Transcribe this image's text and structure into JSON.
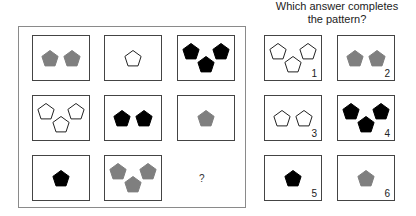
{
  "question": {
    "line1": "Which answer completes",
    "line2": "the pattern?"
  },
  "colors": {
    "gray": "#7f7f7f",
    "black": "#000000",
    "outline": "#222222"
  },
  "matrix": [
    {
      "count": 2,
      "fill": "gray"
    },
    {
      "count": 1,
      "fill": "white"
    },
    {
      "count": 3,
      "fill": "black"
    },
    {
      "count": 3,
      "fill": "white"
    },
    {
      "count": 2,
      "fill": "black"
    },
    {
      "count": 1,
      "fill": "gray"
    },
    {
      "count": 1,
      "fill": "black"
    },
    {
      "count": 3,
      "fill": "gray"
    }
  ],
  "missing_symbol": "?",
  "answers": [
    {
      "label": "1",
      "count": 3,
      "fill": "white"
    },
    {
      "label": "2",
      "count": 2,
      "fill": "gray"
    },
    {
      "label": "3",
      "count": 2,
      "fill": "white"
    },
    {
      "label": "4",
      "count": 3,
      "fill": "black"
    },
    {
      "label": "5",
      "count": 1,
      "fill": "black"
    },
    {
      "label": "6",
      "count": 1,
      "fill": "gray"
    }
  ]
}
